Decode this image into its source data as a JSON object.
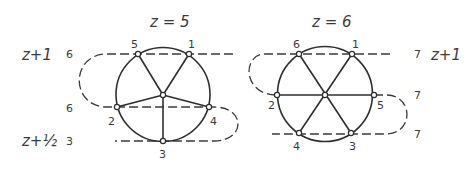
{
  "diagrams": [
    {
      "title": "z = 5",
      "circle": {
        "cx": 163,
        "cy": 94.5,
        "r": 47
      },
      "center": {
        "x": 163,
        "y": 95
      },
      "points": [
        {
          "label": "1",
          "x": 189,
          "y": 54,
          "lx": 191,
          "ly": 47
        },
        {
          "label": "2",
          "x": 117,
          "y": 107,
          "lx": 112,
          "ly": 122
        },
        {
          "label": "3",
          "x": 163,
          "y": 141,
          "lx": 163,
          "ly": 158
        },
        {
          "label": "4",
          "x": 209,
          "y": 107,
          "lx": 214,
          "ly": 122
        },
        {
          "label": "5",
          "x": 138,
          "y": 54,
          "lx": 135,
          "ly": 47
        }
      ],
      "level_labels": [
        {
          "text": "z+1",
          "x": 22,
          "y": 59
        },
        {
          "text": "z+½",
          "x": 22,
          "y": 145
        }
      ],
      "count_labels": [
        {
          "text": "6",
          "x": 67,
          "y": 58
        },
        {
          "text": "6",
          "x": 67,
          "y": 111
        },
        {
          "text": "3",
          "x": 67,
          "y": 145
        }
      ]
    },
    {
      "title": "z = 6",
      "circle": {
        "cx": 325,
        "cy": 94,
        "r": 47
      },
      "center": {
        "x": 325,
        "y": 95
      },
      "points": [
        {
          "label": "1",
          "x": 352,
          "y": 54,
          "lx": 355,
          "ly": 47
        },
        {
          "label": "2",
          "x": 277,
          "y": 95,
          "lx": 272,
          "ly": 108
        },
        {
          "label": "3",
          "x": 351,
          "y": 133,
          "lx": 353,
          "ly": 149
        },
        {
          "label": "4",
          "x": 299,
          "y": 133,
          "lx": 296,
          "ly": 149
        },
        {
          "label": "5",
          "x": 374,
          "y": 95,
          "lx": 380,
          "ly": 108
        },
        {
          "label": "6",
          "x": 299,
          "y": 54,
          "lx": 296,
          "ly": 47
        }
      ],
      "level_labels": [
        {
          "text": "z+1",
          "x": 432,
          "y": 59
        }
      ],
      "count_labels": [
        {
          "text": "7",
          "x": 415,
          "y": 58
        },
        {
          "text": "7",
          "x": 415,
          "y": 99
        },
        {
          "text": "7",
          "x": 415,
          "y": 137
        }
      ]
    }
  ]
}
